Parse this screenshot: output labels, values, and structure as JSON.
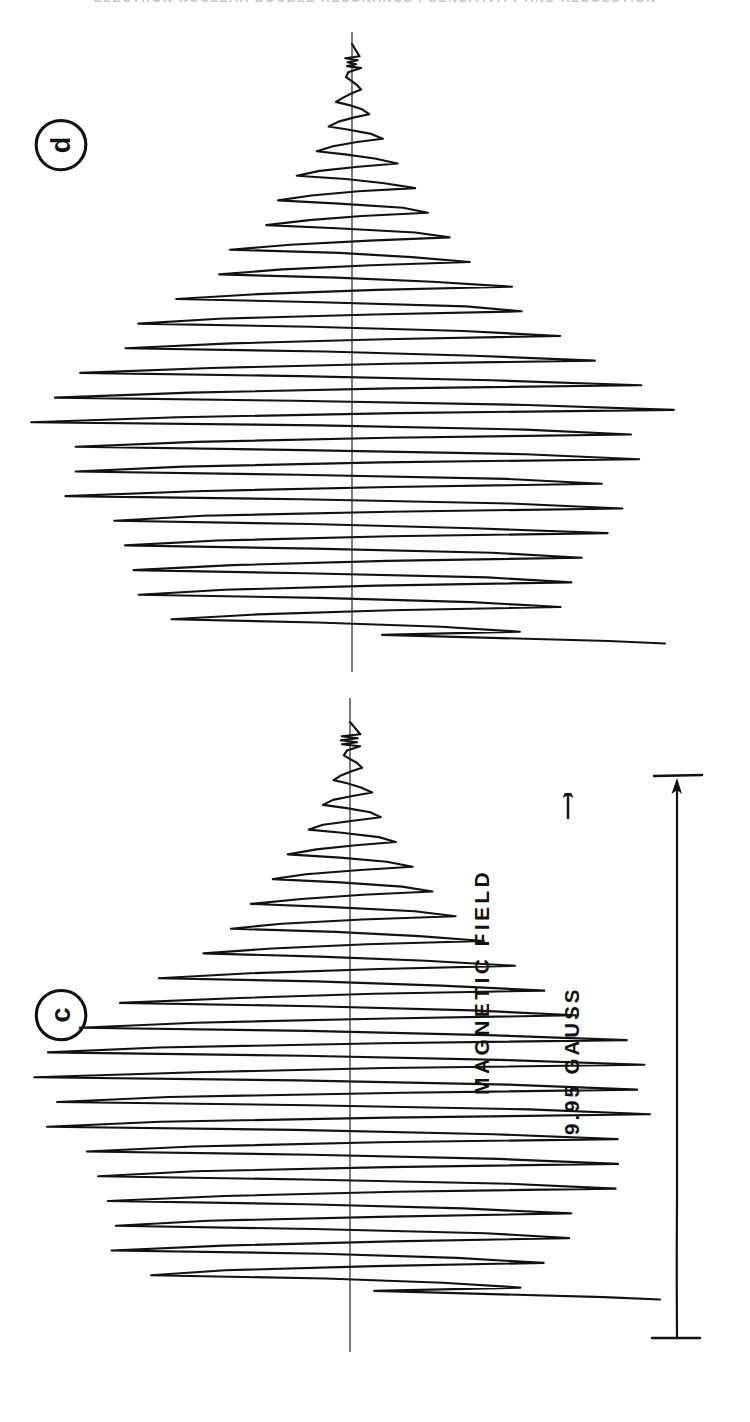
{
  "figure": {
    "running_head": "ELECTRON-NUCLEAR  DOUBLE RESONANCE : SENSITIVITY  AND  RESOLUTION",
    "panels": [
      {
        "id": "d",
        "letter": "d",
        "name": "panel-d"
      },
      {
        "id": "c",
        "letter": "c",
        "name": "panel-c"
      }
    ],
    "axis": {
      "field_label": "MAGNETIC FIELD",
      "field_arrow": "right-arrow-icon",
      "scale_value": "9.95 GAUSS"
    }
  },
  "chart_data": {
    "type": "line",
    "title": "ELECTRON-NUCLEAR DOUBLE RESONANCE : SENSITIVITY AND RESOLUTION",
    "subtitle": "",
    "orientation": "rotated-90-ccw",
    "xlabel": "MAGNETIC FIELD",
    "ylabel": "First-derivative EPR absorption",
    "annotations": [
      "9.95 GAUSS",
      "MAGNETIC FIELD →",
      "c",
      "d"
    ],
    "legend": [],
    "grid": false,
    "scale_bar": {
      "label": "9.95 GAUSS",
      "length_gauss": 9.95
    },
    "series": [
      {
        "name": "d",
        "panel": "d",
        "description": "First-derivative hyperfine EPR spectrum, ~46 resolved oscillations about a flat baseline; amplitude envelope grows from near zero at high field to a maximum at low field then truncates.",
        "n_oscillations": 46,
        "baseline": 0,
        "envelope": [
          0.02,
          0.03,
          0.05,
          0.06,
          0.08,
          0.1,
          0.12,
          0.15,
          0.17,
          0.2,
          0.23,
          0.26,
          0.29,
          0.33,
          0.37,
          0.41,
          0.45,
          0.5,
          0.55,
          0.6,
          0.66,
          0.72,
          0.78,
          0.84,
          0.9,
          0.95,
          1.0,
          1.0,
          0.98,
          0.96,
          0.94,
          0.92,
          0.9,
          0.88,
          0.86,
          0.84,
          0.82,
          0.8,
          0.78,
          0.76,
          0.74,
          0.72,
          0.7,
          0.66,
          0.6,
          0.52
        ],
        "values": [
          0.02,
          -0.03,
          0.05,
          -0.06,
          0.08,
          -0.1,
          0.12,
          -0.15,
          0.17,
          -0.2,
          0.23,
          -0.26,
          0.29,
          -0.33,
          0.37,
          -0.41,
          0.45,
          -0.5,
          0.55,
          -0.6,
          0.66,
          -0.72,
          0.78,
          -0.84,
          0.9,
          -0.95,
          1.0,
          -1.0,
          0.98,
          -0.96,
          0.94,
          -0.92,
          0.9,
          -0.88,
          0.86,
          -0.84,
          0.82,
          -0.8,
          0.78,
          -0.76,
          0.74,
          -0.72,
          0.7,
          -0.66,
          0.6,
          -0.52
        ]
      },
      {
        "name": "c",
        "panel": "c",
        "description": "First-derivative hyperfine EPR spectrum with the same hyperfine pattern as panel d, slightly broader lines and lower resolution at the high-field end.",
        "n_oscillations": 44,
        "baseline": 0,
        "envelope": [
          0.02,
          0.04,
          0.05,
          0.07,
          0.09,
          0.11,
          0.14,
          0.16,
          0.19,
          0.22,
          0.25,
          0.29,
          0.32,
          0.36,
          0.4,
          0.45,
          0.49,
          0.54,
          0.59,
          0.65,
          0.71,
          0.77,
          0.83,
          0.89,
          0.94,
          0.99,
          1.0,
          0.99,
          0.97,
          0.95,
          0.93,
          0.91,
          0.89,
          0.87,
          0.85,
          0.83,
          0.81,
          0.79,
          0.77,
          0.75,
          0.72,
          0.69,
          0.64,
          0.56
        ],
        "values": [
          0.02,
          -0.04,
          0.05,
          -0.07,
          0.09,
          -0.11,
          0.14,
          -0.16,
          0.19,
          -0.22,
          0.25,
          -0.29,
          0.32,
          -0.36,
          0.4,
          -0.45,
          0.49,
          -0.54,
          0.59,
          -0.65,
          0.71,
          -0.77,
          0.83,
          -0.89,
          0.94,
          -0.99,
          1.0,
          -0.99,
          0.97,
          -0.95,
          0.93,
          -0.91,
          0.89,
          -0.87,
          0.85,
          -0.83,
          0.81,
          -0.79,
          0.77,
          -0.75,
          0.72,
          -0.69,
          0.64,
          -0.56
        ]
      }
    ]
  }
}
